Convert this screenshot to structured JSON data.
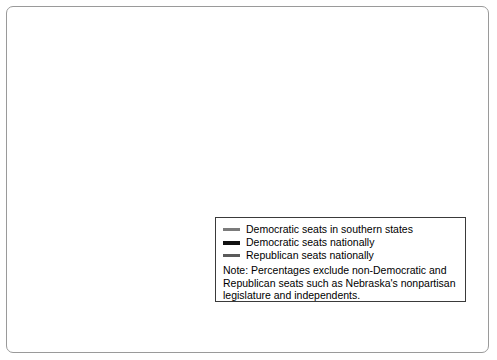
{
  "chart_data": {
    "type": "line",
    "title": "",
    "xlabel": "Year",
    "ylabel": "Percentage",
    "ylim": [
      0,
      100
    ],
    "xlim": [
      1938,
      2008
    ],
    "ytick_step": 10,
    "yminor_step": 5,
    "grid": false,
    "legend_position": "inside-bottom-right",
    "ytick_labels": [
      "0",
      "10",
      "20",
      "30",
      "40",
      "50",
      "60",
      "70",
      "80",
      "90",
      "100"
    ],
    "xtick_labels": [
      "1942",
      "1950",
      "1958",
      "1966",
      "1974",
      "1982",
      "1990",
      "1998",
      "2002",
      "2006",
      "2008"
    ],
    "xtick_label_values": [
      1942,
      1950,
      1958,
      1966,
      1974,
      1982,
      1990,
      1998,
      2002,
      2006,
      2008
    ],
    "x": [
      1938,
      1940,
      1942,
      1944,
      1946,
      1948,
      1950,
      1952,
      1954,
      1956,
      1958,
      1960,
      1962,
      1964,
      1966,
      1968,
      1970,
      1972,
      1974,
      1976,
      1978,
      1980,
      1982,
      1984,
      1986,
      1988,
      1990,
      1992,
      1994,
      1996,
      1998,
      2000,
      2002,
      2004,
      2006,
      2008
    ],
    "series": [
      {
        "name": "Democratic seats in southern states",
        "color": "#7b7b7b",
        "width": 2.2,
        "values": [
          94,
          94,
          93,
          92,
          91,
          90,
          92,
          92,
          92,
          93,
          93,
          93,
          92,
          95,
          94,
          92,
          91,
          90,
          89,
          88,
          86,
          84,
          84,
          83,
          82,
          84,
          83,
          79,
          74,
          72,
          70,
          65,
          61,
          58,
          57,
          56
        ]
      },
      {
        "name": "Democratic seats nationally",
        "color": "#111111",
        "width": 2.6,
        "values": [
          57,
          56,
          50,
          54,
          46,
          56,
          52,
          49,
          53,
          54,
          56,
          57,
          57,
          67,
          65,
          63,
          60,
          63,
          69,
          67,
          64,
          60,
          65,
          62,
          59,
          67,
          68,
          62,
          57,
          55,
          54,
          53,
          52,
          51,
          48,
          42
        ]
      },
      {
        "name": "Republican seats nationally",
        "color": "#5a5a5a",
        "width": 2.2,
        "values": [
          43,
          44,
          50,
          46,
          54,
          44,
          48,
          51,
          47,
          46,
          44,
          40,
          42,
          36,
          35,
          37,
          40,
          37,
          34,
          35,
          40,
          43,
          38,
          41,
          43,
          36,
          35,
          39,
          45,
          47,
          48,
          49,
          50,
          51,
          53,
          59
        ]
      }
    ]
  },
  "legend": {
    "entries": [
      {
        "label": "Democratic seats in southern states"
      },
      {
        "label": "Democratic seats nationally"
      },
      {
        "label": "Republican seats nationally"
      }
    ],
    "note": "Note: Percentages exclude non-Democratic and Republican seats such as Nebraska's nonpartisan legislature and independents."
  }
}
